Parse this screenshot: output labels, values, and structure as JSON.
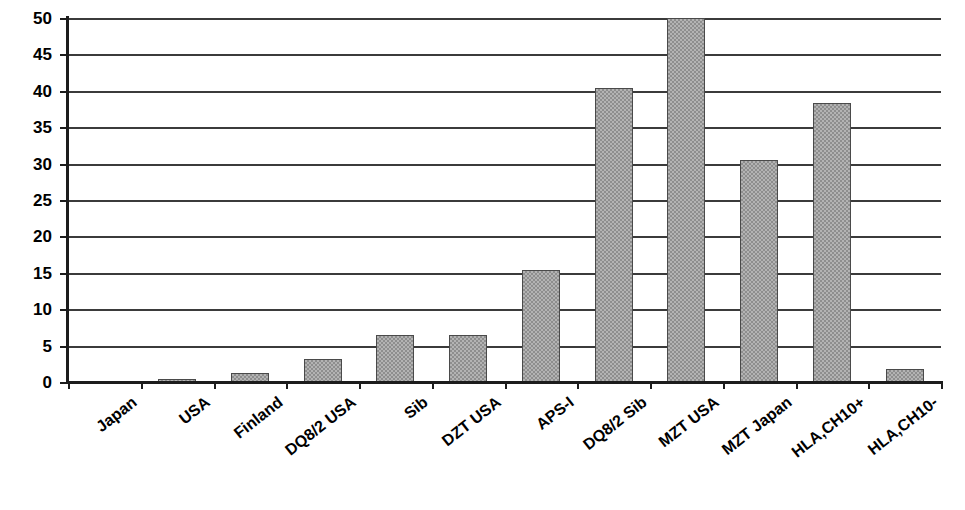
{
  "chart_data": {
    "type": "bar",
    "title": "",
    "subtitle": "",
    "xlabel": "",
    "ylabel": "",
    "ylim": [
      0,
      50
    ],
    "ytick_labels": [
      "0",
      "5",
      "10",
      "15",
      "20",
      "25",
      "30",
      "35",
      "40",
      "45",
      "50"
    ],
    "ytick_values": [
      0,
      5,
      10,
      15,
      20,
      25,
      30,
      35,
      40,
      45,
      50
    ],
    "grid": true,
    "legend": false,
    "legend_position": "none",
    "orientation": "vertical",
    "categories": [
      "Japan",
      "USA",
      "Finland",
      "DQ8/2 USA",
      "Sib",
      "DZT USA",
      "APS-I",
      "DQ8/2 Sib",
      "MZT USA",
      "MZT Japan",
      "HLA,CH10+",
      "HLA,CH10-"
    ],
    "values": [
      0,
      0.4,
      1.3,
      3.2,
      6.4,
      6.5,
      15.4,
      40.4,
      50,
      30.5,
      38.3,
      1.8
    ],
    "series": [
      {
        "name": "Risk",
        "values": [
          0,
          0.4,
          1.3,
          3.2,
          6.4,
          6.5,
          15.4,
          40.4,
          50,
          30.5,
          38.3,
          1.8
        ]
      }
    ],
    "bar_fill": "#b3b3b3",
    "bar_pattern": "checkerboard-hatch",
    "bar_border": "#4a4a4a",
    "axis_color": "#1c1c1c",
    "gridline_color": "#3b3b3b",
    "background": "#ffffff"
  }
}
